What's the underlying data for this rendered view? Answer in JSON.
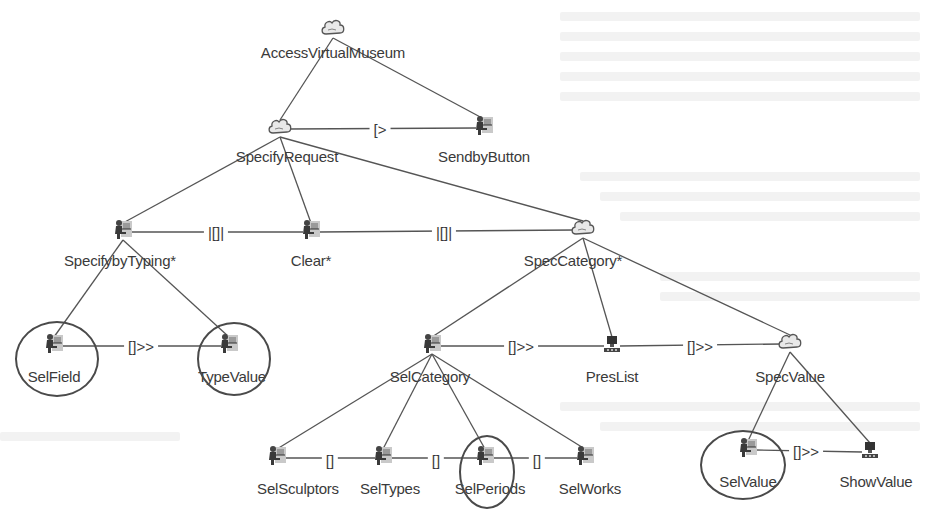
{
  "diagram": {
    "type": "ConcurTaskTrees task model",
    "nodes": [
      {
        "id": "access",
        "label": "AccessVirtualMuseum",
        "kind": "abstraction",
        "icon": "cloud-icon",
        "x": 333,
        "y": 30,
        "lx": 333,
        "ly": 44
      },
      {
        "id": "specreq",
        "label": "SpecifyRequest",
        "kind": "abstraction",
        "icon": "cloud-icon",
        "x": 280,
        "y": 129,
        "lx": 287,
        "ly": 148
      },
      {
        "id": "sendby",
        "label": "SendbyButton",
        "kind": "interaction",
        "icon": "user-interaction-icon",
        "x": 484,
        "y": 128,
        "lx": 484,
        "ly": 148
      },
      {
        "id": "typing",
        "label": "SpecifybyTyping*",
        "kind": "interaction",
        "icon": "user-interaction-icon",
        "x": 123,
        "y": 232,
        "lx": 120,
        "ly": 252
      },
      {
        "id": "clear",
        "label": "Clear*",
        "kind": "interaction",
        "icon": "user-interaction-icon",
        "x": 311,
        "y": 232,
        "lx": 311,
        "ly": 252
      },
      {
        "id": "speccat",
        "label": "SpecCategory*",
        "kind": "abstraction",
        "icon": "cloud-icon",
        "x": 583,
        "y": 230,
        "lx": 573,
        "ly": 252
      },
      {
        "id": "selfield",
        "label": "SelField",
        "kind": "interaction",
        "icon": "user-interaction-icon",
        "x": 54,
        "y": 346,
        "lx": 54,
        "ly": 368
      },
      {
        "id": "typevalue",
        "label": "TypeValue",
        "kind": "interaction",
        "icon": "user-interaction-icon",
        "x": 229,
        "y": 346,
        "lx": 232,
        "ly": 368
      },
      {
        "id": "selcat",
        "label": "SelCategory",
        "kind": "interaction",
        "icon": "user-interaction-icon",
        "x": 432,
        "y": 346,
        "lx": 430,
        "ly": 368
      },
      {
        "id": "preslist",
        "label": "PresList",
        "kind": "application",
        "icon": "computer-icon",
        "x": 612,
        "y": 346,
        "lx": 612,
        "ly": 368
      },
      {
        "id": "specvalue",
        "label": "SpecValue",
        "kind": "abstraction",
        "icon": "cloud-icon",
        "x": 790,
        "y": 344,
        "lx": 790,
        "ly": 368
      },
      {
        "id": "selsculptors",
        "label": "SelSculptors",
        "kind": "interaction",
        "icon": "user-interaction-icon",
        "x": 277,
        "y": 458,
        "lx": 298,
        "ly": 480
      },
      {
        "id": "seltypes",
        "label": "SelTypes",
        "kind": "interaction",
        "icon": "user-interaction-icon",
        "x": 383,
        "y": 458,
        "lx": 390,
        "ly": 480
      },
      {
        "id": "selperiods",
        "label": "SelPeriods",
        "kind": "interaction",
        "icon": "user-interaction-icon",
        "x": 485,
        "y": 458,
        "lx": 490,
        "ly": 480
      },
      {
        "id": "selworks",
        "label": "SelWorks",
        "kind": "interaction",
        "icon": "user-interaction-icon",
        "x": 585,
        "y": 458,
        "lx": 590,
        "ly": 480
      },
      {
        "id": "selvalue",
        "label": "SelValue",
        "kind": "interaction",
        "icon": "user-interaction-icon",
        "x": 748,
        "y": 450,
        "lx": 748,
        "ly": 473
      },
      {
        "id": "showvalue",
        "label": "ShowValue",
        "kind": "application",
        "icon": "computer-icon",
        "x": 870,
        "y": 452,
        "lx": 876,
        "ly": 473
      }
    ],
    "tree_edges": [
      [
        "access",
        "specreq"
      ],
      [
        "access",
        "sendby"
      ],
      [
        "specreq",
        "typing"
      ],
      [
        "specreq",
        "clear"
      ],
      [
        "specreq",
        "speccat"
      ],
      [
        "typing",
        "selfield"
      ],
      [
        "typing",
        "typevalue"
      ],
      [
        "speccat",
        "selcat"
      ],
      [
        "speccat",
        "preslist"
      ],
      [
        "speccat",
        "specvalue"
      ],
      [
        "selcat",
        "selsculptors"
      ],
      [
        "selcat",
        "seltypes"
      ],
      [
        "selcat",
        "selperiods"
      ],
      [
        "selcat",
        "selworks"
      ],
      [
        "specvalue",
        "selvalue"
      ],
      [
        "specvalue",
        "showvalue"
      ]
    ],
    "operators": [
      {
        "from": "specreq",
        "to": "sendby",
        "label": "[>",
        "x": 380,
        "y": 129
      },
      {
        "from": "typing",
        "to": "clear",
        "label": "|[]|",
        "x": 216,
        "y": 232
      },
      {
        "from": "clear",
        "to": "speccat",
        "label": "|[]|",
        "x": 444,
        "y": 232
      },
      {
        "from": "selfield",
        "to": "typevalue",
        "label": "[]>>",
        "x": 141,
        "y": 346
      },
      {
        "from": "selcat",
        "to": "preslist",
        "label": "[]>>",
        "x": 521,
        "y": 346
      },
      {
        "from": "preslist",
        "to": "specvalue",
        "label": "[]>>",
        "x": 700,
        "y": 346
      },
      {
        "from": "selsculptors",
        "to": "seltypes",
        "label": "[]",
        "x": 330,
        "y": 460
      },
      {
        "from": "seltypes",
        "to": "selperiods",
        "label": "[]",
        "x": 436,
        "y": 460
      },
      {
        "from": "selperiods",
        "to": "selworks",
        "label": "[]",
        "x": 537,
        "y": 460
      },
      {
        "from": "selvalue",
        "to": "showvalue",
        "label": "[]>>",
        "x": 806,
        "y": 451
      }
    ],
    "highlighted_nodes": [
      {
        "id": "selfield",
        "cx": 55,
        "cy": 357,
        "rx": 40,
        "ry": 36
      },
      {
        "id": "typevalue",
        "cx": 232,
        "cy": 357,
        "rx": 35,
        "ry": 35
      },
      {
        "id": "selperiods",
        "cx": 485,
        "cy": 470,
        "rx": 26,
        "ry": 35
      },
      {
        "id": "selvalue",
        "cx": 741,
        "cy": 463,
        "rx": 41,
        "ry": 33
      }
    ]
  }
}
